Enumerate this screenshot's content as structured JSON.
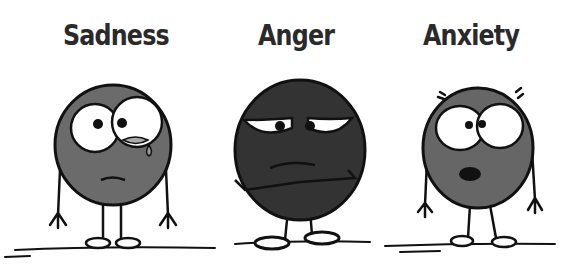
{
  "characters": [
    {
      "label": "Sadness",
      "face_color": "#6b6b6b"
    },
    {
      "label": "Anger",
      "face_color": "#333333"
    },
    {
      "label": "Anxiety",
      "face_color": "#666666"
    }
  ],
  "colors": {
    "outline": "#111111",
    "background": "#ffffff",
    "eye_white": "#ffffff"
  }
}
